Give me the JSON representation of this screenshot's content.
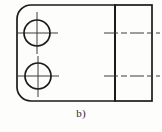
{
  "figure": {
    "caption": "b)",
    "type": "engineering-drawing",
    "background_color": "#fdfdfb",
    "line_color": "#1a1a1a",
    "centerline_color": "#3a3a3a"
  },
  "front_view": {
    "name": "front-view",
    "outline": {
      "x": 17,
      "y": 5,
      "width": 98,
      "height": 96,
      "corner_radius_top_left": 14,
      "corner_radius_bottom_left": 14,
      "corner_radius_top_right": 0,
      "corner_radius_bottom_right": 0
    },
    "holes": [
      {
        "label": "upper-hole",
        "cx": 37,
        "cy": 33,
        "r": 13
      },
      {
        "label": "lower-hole",
        "cx": 38,
        "cy": 76,
        "r": 13
      }
    ],
    "centerlines": [
      {
        "label": "upper-hole-horizontal-centerline",
        "x1": 17,
        "y1": 33,
        "x2": 58,
        "y2": 33
      },
      {
        "label": "upper-hole-vertical-centerline",
        "x1": 37,
        "y1": 12,
        "x2": 37,
        "y2": 54
      },
      {
        "label": "lower-hole-horizontal-centerline",
        "x1": 18,
        "y1": 76,
        "x2": 59,
        "y2": 76
      },
      {
        "label": "lower-hole-vertical-centerline",
        "x1": 38,
        "y1": 56,
        "x2": 38,
        "y2": 97
      }
    ]
  },
  "side_view": {
    "name": "side-view",
    "outline": {
      "x": 115,
      "y": 5,
      "width": 37,
      "height": 96
    },
    "division_line": {
      "label": "plate-thickness-line",
      "x": 115,
      "y1": 5,
      "y2": 101
    },
    "centerlines": [
      {
        "label": "upper-hole-projection-centerline",
        "x1": 104,
        "y1": 33,
        "x2": 160,
        "y2": 33
      },
      {
        "label": "lower-hole-projection-centerline",
        "x1": 104,
        "y1": 76,
        "x2": 160,
        "y2": 76
      }
    ]
  },
  "colors": {
    "outline": "#1a1a1a",
    "centerline": "#3d3d3d",
    "caption_text": "#2b2b2b",
    "paper": "#fdfdfb"
  }
}
